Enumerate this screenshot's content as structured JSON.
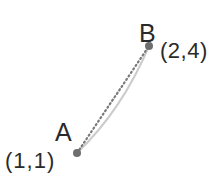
{
  "diagram": {
    "points": [
      {
        "name": "A",
        "coords": "(1,1)"
      },
      {
        "name": "B",
        "coords": "(2,4)"
      }
    ],
    "colors": {
      "point": "#6e6e6e",
      "dotted_segment": "#7a7a7a",
      "curve": "#c8c8c8",
      "text": "#2a2a2a"
    }
  }
}
